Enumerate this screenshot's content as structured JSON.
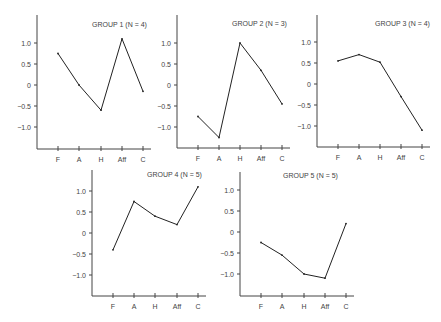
{
  "chart_data": [
    {
      "type": "line",
      "title": "GROUP 1 (N = 4)",
      "categories": [
        "F",
        "A",
        "H",
        "Aff",
        "C"
      ],
      "values": [
        0.75,
        0.0,
        -0.6,
        1.1,
        -0.15
      ],
      "yticks": [
        "1.0",
        "0.5",
        "0",
        "-0.5",
        "-1.0"
      ],
      "ylim": [
        -1.5,
        1.5
      ],
      "grid": false
    },
    {
      "type": "line",
      "title": "GROUP 2 (N = 3)",
      "categories": [
        "F",
        "A",
        "H",
        "Aff",
        "C"
      ],
      "values": [
        -0.75,
        -1.25,
        1.0,
        0.35,
        -0.45
      ],
      "yticks": [
        "1.0",
        "0.5",
        "0",
        "-0.5",
        "-1.0"
      ],
      "ylim": [
        -1.5,
        1.5
      ],
      "grid": false
    },
    {
      "type": "line",
      "title": "GROUP 3 (N = 4)",
      "categories": [
        "F",
        "A",
        "H",
        "Aff",
        "C"
      ],
      "values": [
        0.55,
        0.7,
        0.52,
        -0.3,
        -1.1
      ],
      "yticks": [
        "1.0",
        "0.5",
        "0",
        "-0.5",
        "-1.0"
      ],
      "ylim": [
        -1.5,
        1.5
      ],
      "grid": false
    },
    {
      "type": "line",
      "title": "GROUP 4 (N = 5)",
      "categories": [
        "F",
        "A",
        "H",
        "Aff",
        "C"
      ],
      "values": [
        -0.4,
        0.75,
        0.4,
        0.2,
        1.1
      ],
      "yticks": [
        "1.0",
        "0.5",
        "0",
        "-0.5",
        "-1.0"
      ],
      "ylim": [
        -1.5,
        1.5
      ],
      "grid": false
    },
    {
      "type": "line",
      "title": "GROUP 5 (N = 5)",
      "categories": [
        "F",
        "A",
        "H",
        "Aff",
        "C"
      ],
      "values": [
        -0.25,
        -0.55,
        -1.0,
        -1.1,
        0.2
      ],
      "yticks": [
        "1.0",
        "0.5",
        "0",
        "-0.5",
        "-1.0"
      ],
      "ylim": [
        -1.5,
        1.5
      ],
      "grid": false
    }
  ],
  "layout": [
    {
      "ox": 37,
      "oy": 149,
      "zero": 85,
      "top": 15,
      "xs": [
        58,
        79,
        101,
        122,
        143
      ],
      "title_x": 92,
      "title_y": 27
    },
    {
      "ox": 177,
      "oy": 148,
      "zero": 85,
      "top": 15,
      "xs": [
        198,
        219,
        240,
        261,
        282
      ],
      "title_x": 232,
      "title_y": 26
    },
    {
      "ox": 317,
      "oy": 147,
      "zero": 84,
      "top": 15,
      "xs": [
        338,
        359,
        380,
        401,
        422
      ],
      "title_x": 375,
      "title_y": 26
    },
    {
      "ox": 92,
      "oy": 296,
      "zero": 233,
      "top": 170,
      "xs": [
        113,
        134,
        155,
        177,
        198
      ],
      "title_x": 147,
      "title_y": 177
    },
    {
      "ox": 240,
      "oy": 296,
      "zero": 232,
      "top": 172,
      "xs": [
        261,
        282,
        304,
        325,
        346
      ],
      "title_x": 283,
      "title_y": 178
    }
  ]
}
